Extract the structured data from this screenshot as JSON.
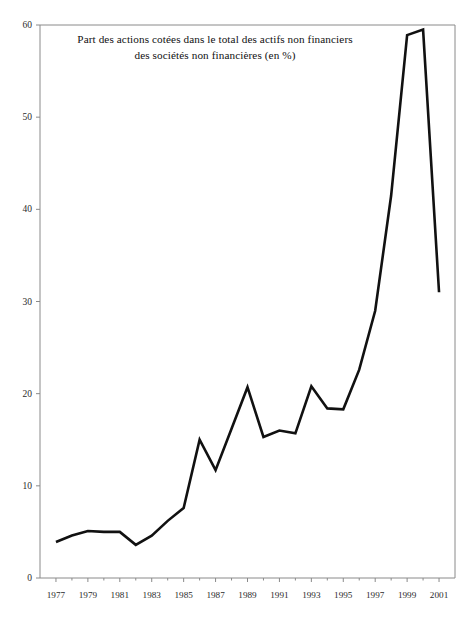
{
  "chart_data": {
    "type": "line",
    "title": "Part des actions cotées dans le total des actifs non financiers des sociétés non financières (en %)",
    "title_lines": [
      "Part des actions cotées dans le total des actifs non financiers",
      "des sociétés non financières (en %)"
    ],
    "xlabel": "",
    "ylabel": "",
    "xlim": [
      1976,
      2002
    ],
    "ylim": [
      0,
      60
    ],
    "grid": false,
    "legend": null,
    "line_color": "#111111",
    "axis_color": "#8a8a8a",
    "background_color": "#ffffff",
    "yticks": [
      0,
      10,
      20,
      30,
      40,
      50,
      60
    ],
    "ytick_labels": [
      "0",
      "10",
      "20",
      "30",
      "40",
      "50",
      "60"
    ],
    "xticks": [
      1977,
      1979,
      1981,
      1983,
      1985,
      1987,
      1989,
      1991,
      1993,
      1995,
      1997,
      1999,
      2001
    ],
    "xtick_labels": [
      "1977",
      "1979",
      "1981",
      "1983",
      "1985",
      "1987",
      "1989",
      "1991",
      "1993",
      "1995",
      "1997",
      "1999",
      "2001"
    ],
    "x": [
      1977,
      1978,
      1979,
      1980,
      1981,
      1982,
      1983,
      1984,
      1985,
      1986,
      1987,
      1988,
      1989,
      1990,
      1991,
      1992,
      1993,
      1994,
      1995,
      1996,
      1997,
      1998,
      1999,
      2000,
      2001
    ],
    "values": [
      3.9,
      4.6,
      5.1,
      5.0,
      5.0,
      3.6,
      4.6,
      6.2,
      7.6,
      15.0,
      11.7,
      16.2,
      20.7,
      15.3,
      16.0,
      15.7,
      20.8,
      18.4,
      18.3,
      22.6,
      29.0,
      41.5,
      58.9,
      59.5,
      31.0
    ],
    "series": [
      {
        "name": "Part des actions cotées (en %)",
        "values": [
          3.9,
          4.6,
          5.1,
          5.0,
          5.0,
          3.6,
          4.6,
          6.2,
          7.6,
          15.0,
          11.7,
          16.2,
          20.7,
          15.3,
          16.0,
          15.7,
          20.8,
          18.4,
          18.3,
          22.6,
          29.0,
          41.5,
          58.9,
          59.5,
          31.0
        ]
      }
    ],
    "annotations": []
  }
}
